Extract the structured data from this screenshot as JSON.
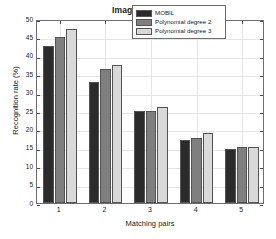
{
  "chart_data": {
    "type": "bar",
    "title": "Image Blur (Trees)",
    "xlabel": "Matching pairs",
    "ylabel": "Recognition rate (%)",
    "categories": [
      "1",
      "2",
      "3",
      "4",
      "5"
    ],
    "series": [
      {
        "name": "MOBIL",
        "color": "#2b2b2b",
        "values": [
          42.7,
          33.0,
          24.9,
          17.0,
          14.8
        ]
      },
      {
        "name": "Polynomial degree 2",
        "color": "#7f7f7f",
        "values": [
          45.2,
          36.3,
          25.1,
          17.8,
          15.2
        ]
      },
      {
        "name": "Polynomial degree 3",
        "color": "#d9d9d9",
        "values": [
          47.2,
          37.4,
          26.0,
          19.0,
          15.2
        ]
      }
    ],
    "ylim": [
      0,
      50
    ],
    "yticks": [
      0,
      5,
      10,
      15,
      20,
      25,
      30,
      35,
      40,
      45,
      50
    ],
    "ytick_labels": [
      "0",
      "5",
      "10",
      "15",
      "20",
      "25",
      "30",
      "35",
      "40",
      "45",
      "50"
    ],
    "grid": true,
    "legend_position": "top-right",
    "axis_color": "#6e6e6e",
    "grid_color": "#e6e6e6",
    "background": "#ffffff"
  }
}
